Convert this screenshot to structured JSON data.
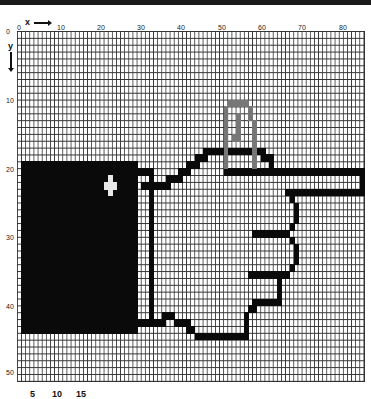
{
  "figure": {
    "type": "pixel-grid-drawing",
    "axis_x": {
      "label": "x",
      "direction": "right",
      "ticks": [
        "0",
        "10",
        "20",
        "30",
        "40",
        "50",
        "60",
        "70",
        "80"
      ]
    },
    "axis_y": {
      "label": "y",
      "direction": "down",
      "ticks": [
        "0",
        "10",
        "20",
        "30",
        "40",
        "50"
      ]
    },
    "grid": {
      "columns": 84,
      "rows": 51,
      "cell_w": 4.13,
      "cell_h": 6.86,
      "origin_px": [
        17,
        31
      ]
    },
    "colors": {
      "ink": "#0a0a0a",
      "grid": "#333333",
      "thumb_outline": "#777777",
      "background": "#ffffff"
    },
    "footer_fragments": [
      "5",
      "10",
      "15"
    ]
  },
  "filled_cells": [
    {
      "c": 1,
      "r": 19,
      "w": 28,
      "h": 25,
      "k": "ink",
      "name": "sleeve"
    },
    {
      "c": 29,
      "r": 20,
      "w": 3,
      "h": 1,
      "k": "ink",
      "name": "cuff-top"
    },
    {
      "c": 32,
      "r": 20,
      "w": 1,
      "h": 23,
      "k": "ink",
      "name": "cuff-right"
    },
    {
      "c": 30,
      "r": 22,
      "w": 2,
      "h": 1,
      "k": "ink",
      "name": "cuff-button"
    },
    {
      "c": 29,
      "r": 42,
      "w": 4,
      "h": 1,
      "k": "ink",
      "name": "cuff-bottom"
    },
    {
      "c": 22,
      "r": 21,
      "w": 1,
      "h": 3,
      "k": "white",
      "name": "sleeve-highlight-v"
    },
    {
      "c": 21,
      "r": 22,
      "w": 3,
      "h": 1,
      "k": "white",
      "name": "sleeve-highlight-h"
    },
    {
      "c": 33,
      "r": 22,
      "w": 4,
      "h": 1,
      "k": "ink",
      "name": "wrist-top"
    },
    {
      "c": 36,
      "r": 21,
      "w": 4,
      "h": 1,
      "k": "ink",
      "name": "hand-edge-1"
    },
    {
      "c": 39,
      "r": 20,
      "w": 3,
      "h": 1,
      "k": "ink",
      "name": "hand-edge-2"
    },
    {
      "c": 41,
      "r": 19,
      "w": 3,
      "h": 1,
      "k": "ink",
      "name": "hand-edge-3"
    },
    {
      "c": 43,
      "r": 18,
      "w": 2,
      "h": 1,
      "k": "ink",
      "name": "hand-edge-4"
    },
    {
      "c": 45,
      "r": 17,
      "w": 1,
      "h": 2,
      "k": "ink",
      "name": "hand-edge-5"
    },
    {
      "c": 46,
      "r": 17,
      "w": 14,
      "h": 1,
      "k": "ink",
      "name": "knuckle-line"
    },
    {
      "c": 59,
      "r": 17,
      "w": 1,
      "h": 2,
      "k": "ink",
      "name": "knuckle-step"
    },
    {
      "c": 60,
      "r": 18,
      "w": 2,
      "h": 1,
      "k": "ink",
      "name": "knuckle-step-2"
    },
    {
      "c": 61,
      "r": 19,
      "w": 1,
      "h": 1,
      "k": "ink",
      "name": "knuckle-step-3"
    },
    {
      "c": 50,
      "r": 20,
      "w": 34,
      "h": 1,
      "k": "ink",
      "name": "finger-top"
    },
    {
      "c": 83,
      "r": 20,
      "w": 1,
      "h": 4,
      "k": "ink",
      "name": "finger-tip"
    },
    {
      "c": 65,
      "r": 23,
      "w": 19,
      "h": 1,
      "k": "ink",
      "name": "finger-bottom"
    },
    {
      "c": 66,
      "r": 24,
      "w": 1,
      "h": 1,
      "k": "ink",
      "name": "contour-1"
    },
    {
      "c": 67,
      "r": 25,
      "w": 1,
      "h": 3,
      "k": "ink",
      "name": "contour-2"
    },
    {
      "c": 66,
      "r": 28,
      "w": 1,
      "h": 1,
      "k": "ink",
      "name": "contour-3"
    },
    {
      "c": 65,
      "r": 29,
      "w": 1,
      "h": 1,
      "k": "ink",
      "name": "contour-4"
    },
    {
      "c": 57,
      "r": 29,
      "w": 9,
      "h": 1,
      "k": "ink",
      "name": "finger-2"
    },
    {
      "c": 66,
      "r": 30,
      "w": 1,
      "h": 1,
      "k": "ink",
      "name": "contour-5"
    },
    {
      "c": 67,
      "r": 31,
      "w": 1,
      "h": 3,
      "k": "ink",
      "name": "contour-6"
    },
    {
      "c": 66,
      "r": 34,
      "w": 1,
      "h": 1,
      "k": "ink",
      "name": "contour-7"
    },
    {
      "c": 65,
      "r": 35,
      "w": 1,
      "h": 1,
      "k": "ink",
      "name": "contour-8"
    },
    {
      "c": 56,
      "r": 35,
      "w": 9,
      "h": 1,
      "k": "ink",
      "name": "finger-3"
    },
    {
      "c": 63,
      "r": 36,
      "w": 1,
      "h": 4,
      "k": "ink",
      "name": "contour-9"
    },
    {
      "c": 57,
      "r": 39,
      "w": 6,
      "h": 1,
      "k": "ink",
      "name": "finger-4"
    },
    {
      "c": 56,
      "r": 40,
      "w": 2,
      "h": 1,
      "k": "ink",
      "name": "finger-4-step"
    },
    {
      "c": 35,
      "r": 41,
      "w": 3,
      "h": 1,
      "k": "ink",
      "name": "palm-bottom-1"
    },
    {
      "c": 32,
      "r": 42,
      "w": 4,
      "h": 1,
      "k": "ink",
      "name": "palm-bottom-0"
    },
    {
      "c": 38,
      "r": 42,
      "w": 4,
      "h": 1,
      "k": "ink",
      "name": "palm-bottom-2"
    },
    {
      "c": 41,
      "r": 43,
      "w": 2,
      "h": 1,
      "k": "ink",
      "name": "palm-bottom-3"
    },
    {
      "c": 43,
      "r": 44,
      "w": 13,
      "h": 1,
      "k": "ink",
      "name": "palm-bottom-4"
    },
    {
      "c": 55,
      "r": 41,
      "w": 1,
      "h": 3,
      "k": "ink",
      "name": "palm-bottom-5"
    },
    {
      "c": 51,
      "r": 10,
      "w": 5,
      "h": 1,
      "k": "gray",
      "name": "thumb-nail-top"
    },
    {
      "c": 50,
      "r": 11,
      "w": 1,
      "h": 9,
      "k": "gray",
      "name": "thumb-left"
    },
    {
      "c": 56,
      "r": 11,
      "w": 1,
      "h": 2,
      "k": "gray",
      "name": "thumb-right-1"
    },
    {
      "c": 57,
      "r": 13,
      "w": 1,
      "h": 7,
      "k": "gray",
      "name": "thumb-right-2"
    },
    {
      "c": 53,
      "r": 12,
      "w": 1,
      "h": 4,
      "k": "gray",
      "name": "thumb-crease"
    },
    {
      "c": 52,
      "r": 15,
      "w": 1,
      "h": 1,
      "k": "gray",
      "name": "thumb-dot"
    }
  ]
}
